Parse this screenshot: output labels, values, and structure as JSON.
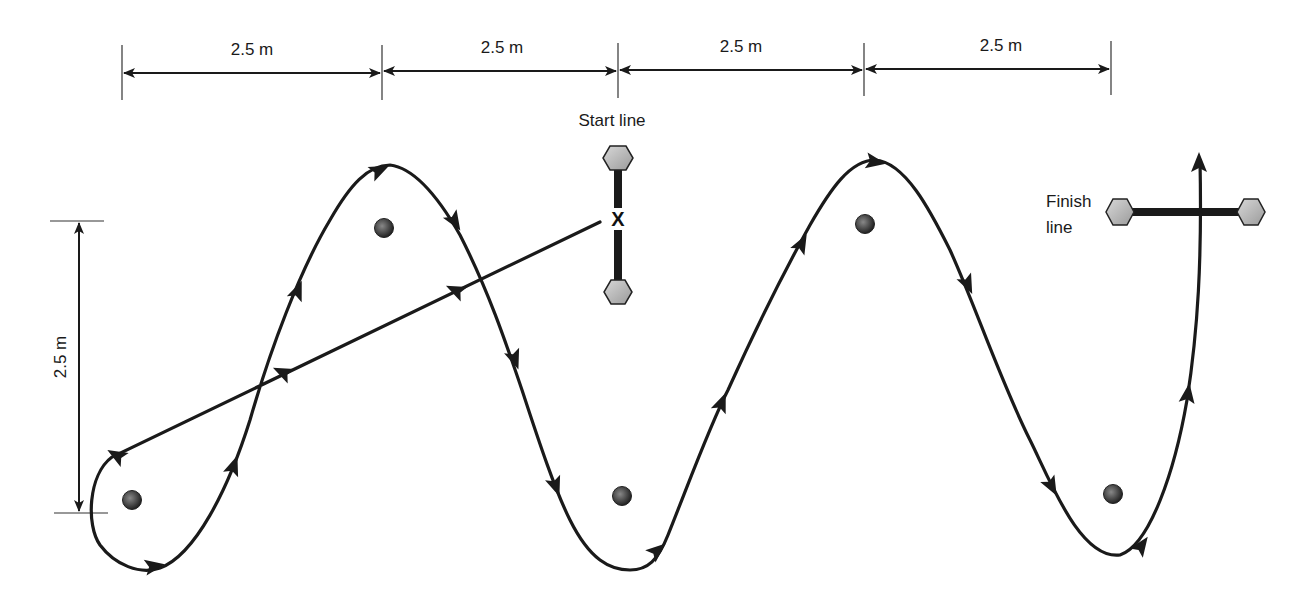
{
  "diagram": {
    "horizontal_dimensions": [
      {
        "label": "2.5 m",
        "x1": 122,
        "x2": 382
      },
      {
        "label": "2.5 m",
        "x1": 382,
        "x2": 618
      },
      {
        "label": "2.5 m",
        "x1": 618,
        "x2": 864
      },
      {
        "label": "2.5 m",
        "x1": 864,
        "x2": 1111
      }
    ],
    "vertical_dimension": {
      "label": "2.5 m"
    },
    "start_line": {
      "label": "Start line",
      "marker": "X"
    },
    "finish_line": {
      "label_line1": "Finish",
      "label_line2": "line"
    },
    "cones": [
      {
        "name": "cone-1",
        "x": 132,
        "y": 500
      },
      {
        "name": "cone-2",
        "x": 384,
        "y": 228
      },
      {
        "name": "cone-3",
        "x": 622,
        "y": 496
      },
      {
        "name": "cone-4",
        "x": 865,
        "y": 224
      },
      {
        "name": "cone-5",
        "x": 1113,
        "y": 494
      }
    ],
    "colors": {
      "line": "#1a1a1a",
      "cone": "#444444",
      "post": "#bbbbbb"
    }
  }
}
